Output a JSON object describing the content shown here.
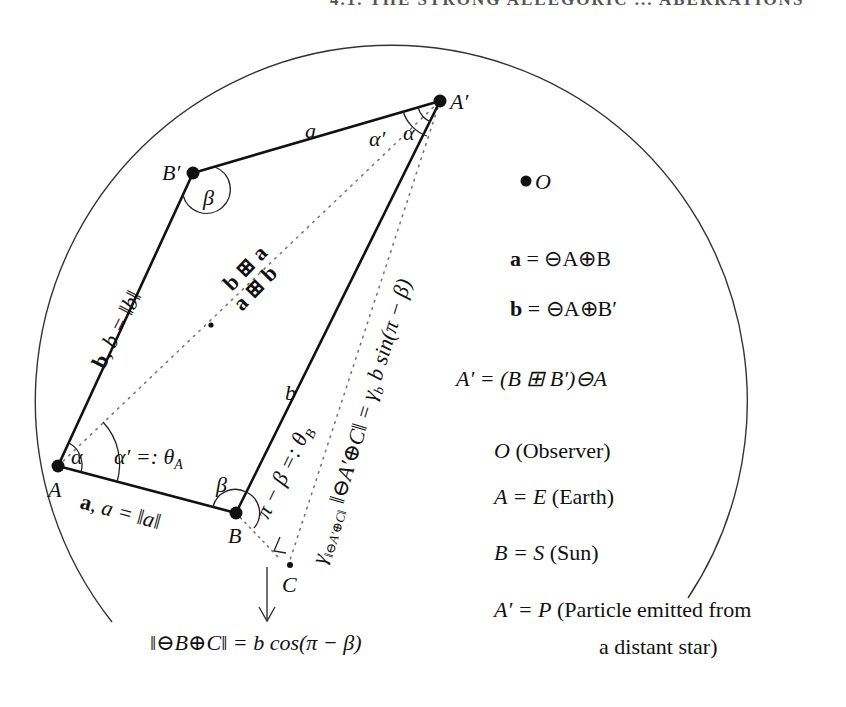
{
  "header": {
    "text": "4.1. THE STRONG ALLEGORIC ... ABERRATIONS"
  },
  "points": {
    "A": {
      "label": "A",
      "x": 58,
      "y": 466
    },
    "B": {
      "label": "B",
      "x": 236,
      "y": 513
    },
    "B_prime": {
      "label": "B′",
      "x": 193,
      "y": 173
    },
    "A_prime": {
      "label": "A′",
      "x": 440,
      "y": 101
    },
    "O": {
      "label": "O",
      "x": 526,
      "y": 181
    },
    "C": {
      "label": "C",
      "x": 290,
      "y": 565
    },
    "M": {
      "x": 211,
      "y": 325
    }
  },
  "edge_labels": {
    "top": "a",
    "left_vec": "b",
    "left_mag": "b = ‖b‖",
    "bottom_vec": "a",
    "bottom_mag": "a = ‖a‖",
    "right": "b",
    "diag_upper": "b ⊞ a",
    "diag_lower": "a ⊞ b",
    "dotted_right": "γ‖⊖A′⊕C‖ ‖⊖A′⊕C‖ = γb b sin(π − β)",
    "dotted_right_main": "‖⊖A′⊕C‖ = γ",
    "dotted_right_sub": "b",
    "dotted_right_tail": " b sin(π − β)",
    "dotted_right_gamma": "γ",
    "dotted_right_gamma_sub": "‖⊖A′⊕C‖",
    "pi_minus_beta": "π − β =: θ",
    "pi_minus_beta_sub": "B"
  },
  "angles": {
    "alpha_A": "α",
    "alpha_prime_A": "α′ =: θ",
    "alpha_prime_A_sub": "A",
    "alpha_Aprime": "α",
    "alpha_prime_Aprime": "α′",
    "beta_Bprime": "β",
    "beta_B": "β"
  },
  "bottom_formula": "‖⊖B⊕C‖ = b cos(π − β)",
  "legend": {
    "a_def_lhs": "a",
    "a_def_rhs": " = ⊖A⊕B",
    "b_def_lhs": "b",
    "b_def_rhs": " = ⊖A⊕B′",
    "aprime_def": "A′ = (B ⊞ B′)⊖A",
    "O_sym": "O",
    "O_txt": " (Observer)",
    "A_sym": "A = E",
    "A_txt": " (Earth)",
    "B_sym": "B = S",
    "B_txt": " (Sun)",
    "P_sym": "A′ = P",
    "P_txt": " (Particle emitted from",
    "P_txt2": "a distant star)"
  },
  "colors": {
    "ink": "#111111",
    "circle": "#333333",
    "dots": "#777777"
  }
}
